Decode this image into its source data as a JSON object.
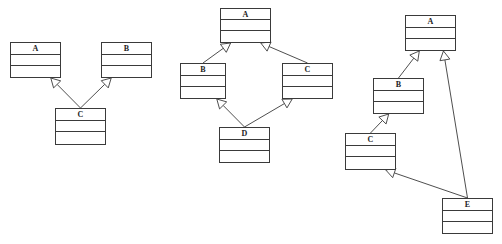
{
  "colors": {
    "line": "#3a3a3a",
    "background": "#ffffff"
  },
  "diagrams": [
    {
      "name": "multiple-inheritance",
      "classes": [
        {
          "id": "A",
          "label": "A",
          "x": 10,
          "y": 42,
          "w": 51,
          "h": 36
        },
        {
          "id": "B",
          "label": "B",
          "x": 101,
          "y": 42,
          "w": 51,
          "h": 36
        },
        {
          "id": "C",
          "label": "C",
          "x": 55,
          "y": 108,
          "w": 51,
          "h": 37
        }
      ],
      "relations": [
        {
          "type": "generalization",
          "from": "C",
          "to": "A"
        },
        {
          "type": "generalization",
          "from": "C",
          "to": "B"
        }
      ]
    },
    {
      "name": "diamond-inheritance",
      "classes": [
        {
          "id": "A",
          "label": "A",
          "x": 220,
          "y": 8,
          "w": 51,
          "h": 35
        },
        {
          "id": "B",
          "label": "B",
          "x": 180,
          "y": 63,
          "w": 46,
          "h": 36
        },
        {
          "id": "C",
          "label": "C",
          "x": 282,
          "y": 63,
          "w": 51,
          "h": 36
        },
        {
          "id": "D",
          "label": "D",
          "x": 219,
          "y": 127,
          "w": 51,
          "h": 36
        }
      ],
      "relations": [
        {
          "type": "generalization",
          "from": "B",
          "to": "A"
        },
        {
          "type": "generalization",
          "from": "C",
          "to": "A"
        },
        {
          "type": "generalization",
          "from": "D",
          "to": "B"
        },
        {
          "type": "generalization",
          "from": "D",
          "to": "C"
        }
      ]
    },
    {
      "name": "chain-inheritance",
      "classes": [
        {
          "id": "A",
          "label": "A",
          "x": 405,
          "y": 15,
          "w": 51,
          "h": 36
        },
        {
          "id": "B",
          "label": "B",
          "x": 373,
          "y": 78,
          "w": 51,
          "h": 36
        },
        {
          "id": "C",
          "label": "C",
          "x": 345,
          "y": 133,
          "w": 51,
          "h": 37
        },
        {
          "id": "E",
          "label": "E",
          "x": 442,
          "y": 198,
          "w": 51,
          "h": 36
        }
      ],
      "relations": [
        {
          "type": "generalization",
          "from": "B",
          "to": "A"
        },
        {
          "type": "generalization",
          "from": "C",
          "to": "B"
        },
        {
          "type": "generalization",
          "from": "E",
          "to": "C"
        },
        {
          "type": "generalization",
          "from": "E",
          "to": "A"
        }
      ]
    }
  ]
}
